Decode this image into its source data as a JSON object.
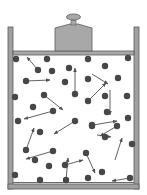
{
  "diagram": {
    "colors": {
      "wall_fill": "#a0a0a0",
      "wall_stroke": "#5a5a5a",
      "piston_fill": "#a8a8a8",
      "piston_stroke": "#5a5a5a",
      "particle": "#474747",
      "arrow": "#505050",
      "background": "#ffffff"
    },
    "particle_count": 42,
    "arrow_count": 19
  }
}
